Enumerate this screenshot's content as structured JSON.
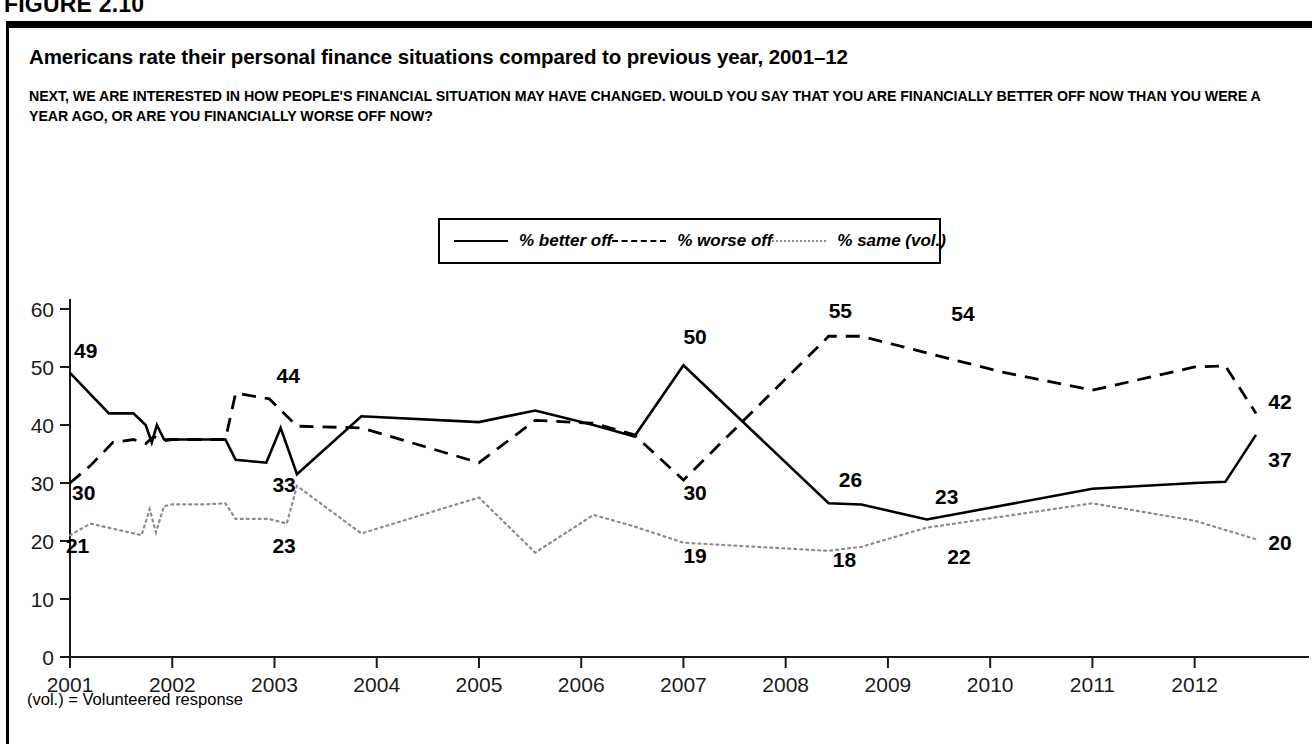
{
  "figure": {
    "label": "FIGURE 2.10",
    "title": "Americans rate their personal finance situations compared to previous year, 2001–12",
    "question": "NEXT, WE ARE INTERESTED IN HOW PEOPLE'S FINANCIAL SITUATION MAY HAVE CHANGED. WOULD YOU SAY THAT YOU ARE FINANCIALLY BETTER OFF NOW THAN YOU WERE A YEAR AGO, OR ARE YOU FINANCIALLY WORSE OFF NOW?",
    "footnote": "(vol.) = Volunteered response",
    "source_partial": "SOURCE: “Americans rate their personal finance situations compared to previous year,” in financially better off"
  },
  "chart_data": {
    "type": "line",
    "title": "Americans rate their personal finance situations compared to previous year, 2001–12",
    "xlabel": "",
    "ylabel": "",
    "xlim": [
      2001,
      2012.6
    ],
    "ylim": [
      0,
      60
    ],
    "ytick_values": [
      0,
      10,
      20,
      30,
      40,
      50,
      60
    ],
    "xtick_labels": [
      "2001",
      "2002",
      "2003",
      "2004",
      "2005",
      "2006",
      "2007",
      "2008",
      "2009",
      "2010",
      "2011",
      "2012"
    ],
    "xtick_values": [
      2001,
      2002,
      2003,
      2004,
      2005,
      2006,
      2007,
      2008,
      2009,
      2010,
      2011,
      2012
    ],
    "grid": false,
    "legend_position": "top-center",
    "series": [
      {
        "name": "% better off",
        "style": "solid",
        "color": "#000000",
        "points": [
          [
            2001.0,
            49
          ],
          [
            2001.38,
            42
          ],
          [
            2001.62,
            42
          ],
          [
            2001.74,
            40
          ],
          [
            2001.8,
            37
          ],
          [
            2001.85,
            40
          ],
          [
            2001.92,
            37.5
          ],
          [
            2002.0,
            37.5
          ],
          [
            2002.3,
            37.5
          ],
          [
            2002.52,
            37.5
          ],
          [
            2002.62,
            34
          ],
          [
            2002.92,
            33.5
          ],
          [
            2003.06,
            39.5
          ],
          [
            2003.22,
            31.5
          ],
          [
            2003.85,
            41.5
          ],
          [
            2005.0,
            40.5
          ],
          [
            2005.55,
            42.5
          ],
          [
            2006.12,
            40
          ],
          [
            2006.52,
            38
          ],
          [
            2007.0,
            50.3
          ],
          [
            2008.42,
            26.5
          ],
          [
            2008.74,
            26.3
          ],
          [
            2009.38,
            23.7
          ],
          [
            2011.0,
            29
          ],
          [
            2012.0,
            30
          ],
          [
            2012.3,
            30.2
          ],
          [
            2012.6,
            38.3
          ]
        ]
      },
      {
        "name": "% worse off",
        "style": "dashed",
        "color": "#000000",
        "points": [
          [
            2001.0,
            30
          ],
          [
            2001.2,
            33
          ],
          [
            2001.42,
            37
          ],
          [
            2001.62,
            37.5
          ],
          [
            2001.74,
            36.8
          ],
          [
            2001.82,
            38
          ],
          [
            2001.92,
            37.3
          ],
          [
            2002.0,
            37.5
          ],
          [
            2002.3,
            37.5
          ],
          [
            2002.52,
            37.5
          ],
          [
            2002.62,
            45.5
          ],
          [
            2002.95,
            44.5
          ],
          [
            2003.22,
            39.8
          ],
          [
            2003.85,
            39.5
          ],
          [
            2005.0,
            33.5
          ],
          [
            2005.55,
            40.8
          ],
          [
            2006.12,
            40.3
          ],
          [
            2006.52,
            38.3
          ],
          [
            2007.0,
            30.5
          ],
          [
            2008.42,
            55.3
          ],
          [
            2008.74,
            55.3
          ],
          [
            2010.1,
            49.2
          ],
          [
            2011.0,
            46
          ],
          [
            2012.0,
            50
          ],
          [
            2012.3,
            50.2
          ],
          [
            2012.6,
            42
          ]
        ]
      },
      {
        "name": "% same (vol.)",
        "style": "dotted",
        "color": "#8c8c8c",
        "points": [
          [
            2001.0,
            21
          ],
          [
            2001.2,
            23
          ],
          [
            2001.45,
            22
          ],
          [
            2001.7,
            21
          ],
          [
            2001.78,
            25.5
          ],
          [
            2001.84,
            21.5
          ],
          [
            2001.92,
            26
          ],
          [
            2002.0,
            26.3
          ],
          [
            2002.3,
            26.3
          ],
          [
            2002.52,
            26.5
          ],
          [
            2002.62,
            23.8
          ],
          [
            2002.95,
            23.8
          ],
          [
            2003.12,
            23
          ],
          [
            2003.22,
            29.5
          ],
          [
            2003.85,
            21.3
          ],
          [
            2005.0,
            27.5
          ],
          [
            2005.55,
            18
          ],
          [
            2006.12,
            24.5
          ],
          [
            2006.52,
            22.5
          ],
          [
            2007.0,
            19.7
          ],
          [
            2008.42,
            18.3
          ],
          [
            2008.74,
            19
          ],
          [
            2009.38,
            22.3
          ],
          [
            2011.0,
            26.5
          ],
          [
            2012.0,
            23.5
          ],
          [
            2012.6,
            20.3
          ]
        ]
      }
    ],
    "data_labels": [
      {
        "text": "49",
        "x": 2001.04,
        "y": 51.6,
        "series": "% better off"
      },
      {
        "text": "30",
        "x": 2001.02,
        "y": 27.0,
        "series": "% worse off"
      },
      {
        "text": "21",
        "x": 2000.96,
        "y": 18.0,
        "series": "% same (vol.)"
      },
      {
        "text": "44",
        "x": 2003.02,
        "y": 47.3,
        "series": "% worse off"
      },
      {
        "text": "33",
        "x": 2002.98,
        "y": 28.5,
        "series": "% better off"
      },
      {
        "text": "23",
        "x": 2002.98,
        "y": 18.0,
        "series": "% same (vol.)"
      },
      {
        "text": "50",
        "x": 2007.0,
        "y": 54.0,
        "series": "% better off"
      },
      {
        "text": "30",
        "x": 2007.0,
        "y": 27.0,
        "series": "% worse off"
      },
      {
        "text": "19",
        "x": 2007.0,
        "y": 16.2,
        "series": "% same (vol.)"
      },
      {
        "text": "55",
        "x": 2008.42,
        "y": 58.4,
        "series": "% worse off"
      },
      {
        "text": "26",
        "x": 2008.52,
        "y": 29.3,
        "series": "% better off"
      },
      {
        "text": "18",
        "x": 2008.46,
        "y": 15.6,
        "series": "% same (vol.)"
      },
      {
        "text": "54",
        "x": 2009.62,
        "y": 58.0,
        "series": "% worse off"
      },
      {
        "text": "23",
        "x": 2009.46,
        "y": 26.4,
        "series": "% better off"
      },
      {
        "text": "22",
        "x": 2009.58,
        "y": 16.1,
        "series": "% same (vol.)"
      },
      {
        "text": "42",
        "x": 2012.72,
        "y": 42.8,
        "series": "% worse off"
      },
      {
        "text": "37",
        "x": 2012.72,
        "y": 32.8,
        "series": "% better off"
      },
      {
        "text": "20",
        "x": 2012.72,
        "y": 18.4,
        "series": "% same (vol.)"
      }
    ]
  },
  "legend": {
    "items": [
      {
        "label": "% better off",
        "style": "solid"
      },
      {
        "label": "% worse off",
        "style": "dashed"
      },
      {
        "label": "% same (vol.)",
        "style": "dotted"
      }
    ]
  }
}
